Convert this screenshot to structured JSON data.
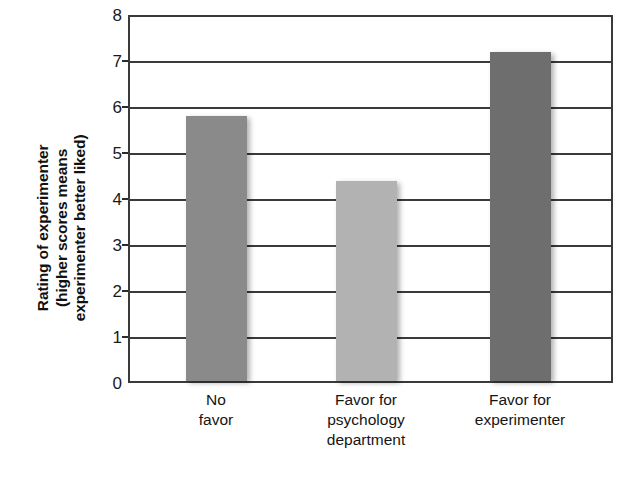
{
  "chart_data": {
    "type": "bar",
    "title": "",
    "xlabel": "",
    "ylabel": "Rating of experimenter (higher scores means experimenter better liked)",
    "ylabel_lines": [
      "Rating of experimenter",
      "(higher scores means",
      "experimenter better liked)"
    ],
    "categories": [
      "No favor",
      "Favor for psychology department",
      "Favor for experimenter"
    ],
    "category_lines": [
      [
        "No",
        "favor"
      ],
      [
        "Favor for",
        "psychology",
        "department"
      ],
      [
        "Favor for",
        "experimenter"
      ]
    ],
    "values": [
      5.8,
      4.4,
      7.2
    ],
    "bar_colors": [
      "#8a8a8a",
      "#b2b2b2",
      "#6e6e6e"
    ],
    "ylim": [
      0,
      8
    ],
    "ytick_values": [
      0,
      1,
      2,
      3,
      4,
      5,
      6,
      7,
      8
    ],
    "ytick_labels": [
      "0",
      "1",
      "2",
      "3",
      "4",
      "5",
      "6",
      "7",
      "8"
    ],
    "grid": true,
    "grid_orientation": "horizontal",
    "legend": null,
    "legend_position": "none",
    "axis_color": "#3a3a3a",
    "background_color": "#ffffff"
  }
}
